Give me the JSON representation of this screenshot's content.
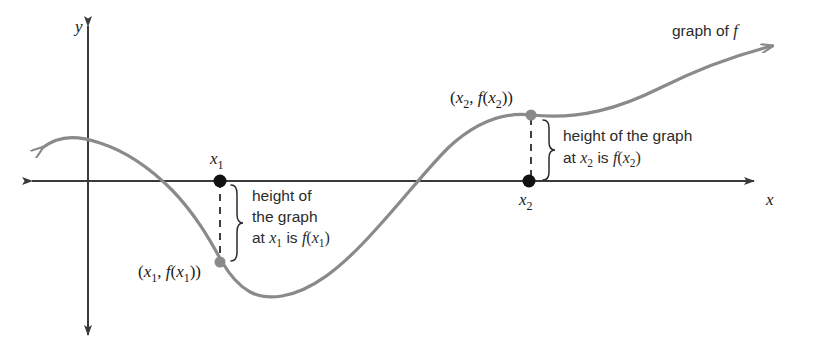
{
  "figure": {
    "width": 816,
    "height": 362,
    "background": "#ffffff",
    "curve_color": "#8a8a8a",
    "axis_color": "#3a3a3a",
    "text_color": "#1a1a1a",
    "dot_black": "#111111",
    "dot_gray": "#8a8a8a"
  },
  "axes": {
    "x_axis": {
      "label": "x",
      "label_x": 766,
      "label_y": 205,
      "y": 181,
      "x_start": 26,
      "x_end": 760,
      "arrow_left": true,
      "arrow_right": true
    },
    "y_axis": {
      "label": "y",
      "label_x": 75,
      "label_y": 32,
      "x": 88,
      "y_start": 20,
      "y_end": 341,
      "arrow_up": true,
      "arrow_down": true
    }
  },
  "curve": {
    "label": "graph of f",
    "label_x": 672,
    "label_y": 36,
    "label_italic_tail": "f",
    "path": "M 42,148 C 62,133 82,137 100,143 C 128,152 150,168 172,190 C 196,215 210,240 222,262 C 240,292 258,300 282,296 C 312,291 340,268 368,238 C 400,204 424,172 448,148 C 478,120 505,112 531,115 C 580,120 620,108 660,88 C 700,68 740,54 772,46",
    "arrow_start": {
      "x": 42,
      "y": 148
    },
    "arrow_end": {
      "x": 776,
      "y": 44
    }
  },
  "points": [
    {
      "name": "x1-axis-point",
      "x": 220,
      "y": 181,
      "color": "black",
      "label": "x₁",
      "label_base": "x",
      "label_sub": "1",
      "label_x": 217,
      "label_y": 163
    },
    {
      "name": "x1-curve-point",
      "x": 220,
      "y": 262,
      "color": "gray",
      "label": "(x₁, f(x₁))",
      "label_x": 140,
      "label_y": 277
    },
    {
      "name": "x2-axis-point",
      "x": 529,
      "y": 181,
      "color": "black",
      "label": "x₂",
      "label_base": "x",
      "label_sub": "2",
      "label_x": 525,
      "label_y": 203
    },
    {
      "name": "x2-curve-point",
      "x": 531,
      "y": 115,
      "color": "gray",
      "label": "(x₂, f(x₂))",
      "label_x": 452,
      "label_y": 102
    }
  ],
  "annotations": [
    {
      "id": "x1-height",
      "dash_x": 220,
      "dash_top": 181,
      "dash_bottom": 262,
      "brace_x": 236,
      "brace_top": 185,
      "brace_bottom": 262,
      "text_x": 252,
      "lines": [
        {
          "text": "height of",
          "y": 201
        },
        {
          "text": "the graph",
          "y": 222
        },
        {
          "text": "at x₁ is f(x₁)",
          "y": 243
        }
      ]
    },
    {
      "id": "x2-height",
      "dash_x": 531,
      "dash_top": 118,
      "dash_bottom": 181,
      "brace_x": 548,
      "brace_top": 120,
      "brace_bottom": 180,
      "text_x": 563,
      "lines": [
        {
          "text": "height of the graph",
          "y": 141
        },
        {
          "text": "at x₂ is f(x₂)",
          "y": 163
        }
      ]
    }
  ]
}
